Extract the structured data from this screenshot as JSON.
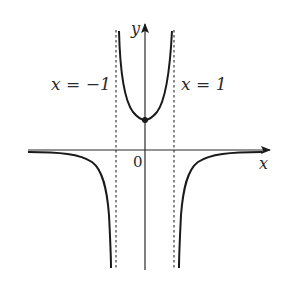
{
  "figure": {
    "type": "function-graph",
    "axes": {
      "x_label": "x",
      "y_label": "y",
      "origin_label": "0"
    },
    "asymptotes": [
      {
        "label": "x = −1",
        "x": -1,
        "style": "dashed"
      },
      {
        "label": "x = 1",
        "x": 1,
        "style": "dashed"
      }
    ],
    "curve": {
      "description": "Even function with vertical asymptotes at x = -1 and x = 1 and horizontal asymptote y = 0",
      "branches": [
        {
          "name": "left",
          "domain": "x < -1",
          "behavior": "approaches 0 from below as x→-∞, tends to -∞ as x→-1⁻"
        },
        {
          "name": "middle",
          "domain": "-1 < x < 1",
          "behavior": "U-shaped, minimum at y-intercept, tends to +∞ near both asymptotes"
        },
        {
          "name": "right",
          "domain": "x > 1",
          "behavior": "tends to -∞ as x→1⁺, approaches 0 from below as x→+∞"
        }
      ],
      "marked_point": {
        "description": "y-intercept (local minimum)",
        "x": 0
      }
    },
    "colors": {
      "line": "#1a1a1a",
      "background": "#ffffff"
    }
  }
}
